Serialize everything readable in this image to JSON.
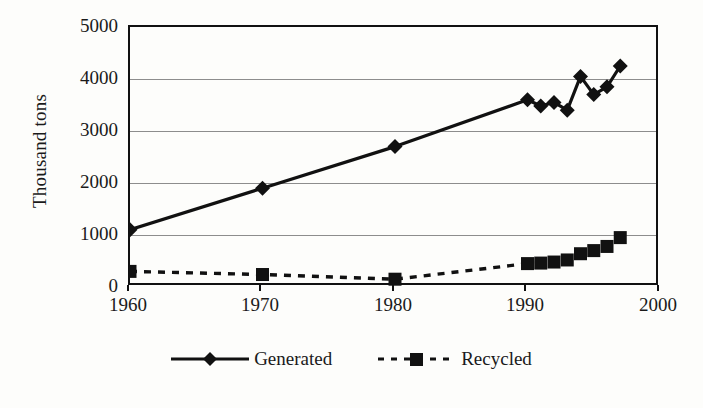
{
  "chart_data": {
    "type": "line",
    "title": "",
    "xlabel": "",
    "ylabel": "Thousand tons",
    "xlim": [
      1960,
      2000
    ],
    "ylim": [
      0,
      5000
    ],
    "xticks": [
      "1960",
      "1970",
      "1980",
      "1990",
      "2000"
    ],
    "yticks": [
      "0",
      "1000",
      "2000",
      "3000",
      "4000",
      "5000"
    ],
    "grid": "horizontal",
    "legend_position": "bottom",
    "series": [
      {
        "name": "Generated",
        "marker": "diamond",
        "line_style": "solid",
        "color": "#111111",
        "x": [
          1960,
          1970,
          1980,
          1990,
          1991,
          1992,
          1993,
          1994,
          1995,
          1996,
          1997
        ],
        "values": [
          1100,
          1900,
          2700,
          3600,
          3480,
          3550,
          3400,
          4050,
          3700,
          3850,
          4250
        ]
      },
      {
        "name": "Recycled",
        "marker": "square",
        "line_style": "dashed",
        "color": "#111111",
        "x": [
          1960,
          1970,
          1980,
          1990,
          1991,
          1992,
          1993,
          1994,
          1995,
          1996,
          1997
        ],
        "values": [
          300,
          240,
          150,
          450,
          460,
          480,
          520,
          640,
          700,
          780,
          950
        ]
      }
    ]
  },
  "axis": {
    "y_title": "Thousand tons",
    "y_ticks": [
      "5000",
      "4000",
      "3000",
      "2000",
      "1000",
      "0"
    ],
    "x_ticks": [
      "1960",
      "1970",
      "1980",
      "1990",
      "2000"
    ]
  },
  "legend": {
    "generated_label": "Generated",
    "recycled_label": "Recycled"
  }
}
